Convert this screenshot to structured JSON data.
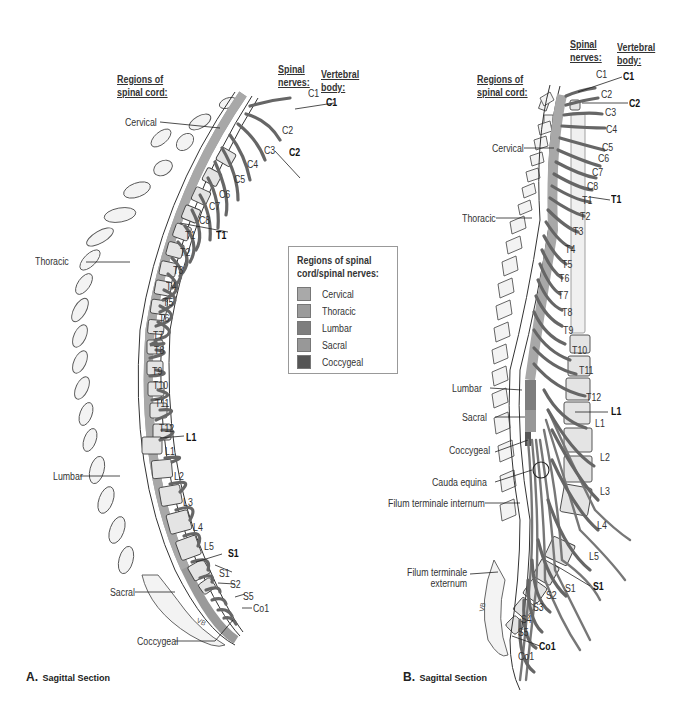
{
  "panel_a": {
    "caption_letter": "A.",
    "caption_text": "Sagittal Section",
    "header_regions": [
      "Regions of",
      "spinal cord:"
    ],
    "header_nerves": [
      "Spinal",
      "nerves:"
    ],
    "header_vertebral": [
      "Vertebral",
      "body:"
    ],
    "regions": [
      "Cervical",
      "Thoracic",
      "Lumbar",
      "Sacral",
      "Coccygeal"
    ],
    "spinal_nerves": [
      "C1",
      "C2",
      "C3",
      "C4",
      "C5",
      "C6",
      "C7",
      "C8",
      "T1",
      "T2",
      "T3",
      "T4",
      "T5",
      "T6",
      "T7",
      "T8",
      "T9",
      "T10",
      "T11",
      "T12",
      "L1",
      "L2",
      "L3",
      "L4",
      "L5",
      "S1",
      "S2",
      "S5",
      "Co1"
    ],
    "vertebral_bodies": [
      "C1",
      "C2",
      "T1",
      "L1",
      "S1"
    ],
    "annotation_vb": "VB"
  },
  "legend": {
    "title": [
      "Regions of spinal",
      "cord/spinal nerves:"
    ],
    "items": [
      {
        "label": "Cervical",
        "color": "#a9a9a9"
      },
      {
        "label": "Thoracic",
        "color": "#9b9b9b"
      },
      {
        "label": "Lumbar",
        "color": "#7e7e7e"
      },
      {
        "label": "Sacral",
        "color": "#989898"
      },
      {
        "label": "Coccygeal",
        "color": "#555555"
      }
    ]
  },
  "panel_b": {
    "caption_letter": "B.",
    "caption_text": "Sagittal Section",
    "header_regions": [
      "Regions of",
      "spinal cord:"
    ],
    "header_nerves": [
      "Spinal",
      "nerves:"
    ],
    "header_vertebral": [
      "Vertebral",
      "body:"
    ],
    "regions": [
      "Cervical",
      "Thoracic",
      "Lumbar",
      "Sacral",
      "Coccygeal",
      "Cauda equina",
      "Filum terminale internum",
      "Filum terminale externum"
    ],
    "filum_externum_lines": [
      "Filum terminale",
      "externum"
    ],
    "spinal_nerves": [
      "C1",
      "C2",
      "C3",
      "C4",
      "C5",
      "C6",
      "C7",
      "C8",
      "T1",
      "T2",
      "T3",
      "T4",
      "T5",
      "T6",
      "T7",
      "T8",
      "T9",
      "T10",
      "T11",
      "T12",
      "L1",
      "L2",
      "L3",
      "L4",
      "L5",
      "S1",
      "S2",
      "S3",
      "S4",
      "S5",
      "Co1"
    ],
    "vertebral_bodies": [
      "C1",
      "C2",
      "T1",
      "L1",
      "S1",
      "Co1"
    ]
  }
}
